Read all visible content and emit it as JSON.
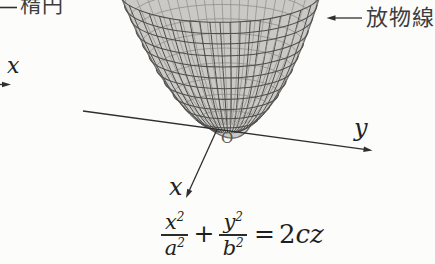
{
  "figure": {
    "labels": {
      "ellipse": "楕円",
      "parabola": "放物線",
      "axis_y": "y",
      "axis_x": "x",
      "origin": "O",
      "cropped_axis_x": "x"
    },
    "equation": {
      "frac1_num_base": "x",
      "frac1_num_sup": "2",
      "frac1_den_base": "a",
      "frac1_den_sup": "2",
      "operator_plus": "+",
      "frac2_num_base": "y",
      "frac2_num_sup": "2",
      "frac2_den_base": "b",
      "frac2_den_sup": "2",
      "equals": "=",
      "rhs_coeff": "2",
      "rhs_vars": "cz"
    },
    "colors": {
      "background": "#fcfcfa",
      "axis_line": "#2f2f2f",
      "label_text": "#3d3d3d"
    }
  },
  "mesh": {
    "vertex_x": 228,
    "vertex_y": 132,
    "top_y": -8,
    "rx_max": 101,
    "ry_ratio": 0.3,
    "center_shift": -8,
    "latitudes": 11,
    "longitudes": 19,
    "bottom_dip_x": 237,
    "bottom_dip_y": 152,
    "surface_fill": "#cac9c6",
    "edge_line": "#6e6e6a",
    "front_line": "#4e4e4c",
    "back_line": "#8f8f8a"
  }
}
